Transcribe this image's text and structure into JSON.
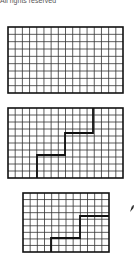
{
  "header": {
    "caption": "All rights reserved"
  },
  "figures": [
    {
      "id": "grid-plain",
      "x": 8,
      "y": 27,
      "width": 115,
      "height": 66,
      "cols": 16,
      "rows": 9,
      "path": []
    },
    {
      "id": "grid-staircase-1",
      "x": 8,
      "y": 108,
      "width": 115,
      "height": 70,
      "cols": 16,
      "rows": 10,
      "path": [
        [
          37,
          178
        ],
        [
          37,
          155
        ],
        [
          65,
          155
        ],
        [
          65,
          133
        ],
        [
          93,
          133
        ],
        [
          93,
          108
        ]
      ]
    },
    {
      "id": "grid-staircase-2",
      "x": 23,
      "y": 193,
      "width": 86,
      "height": 59,
      "cols": 12,
      "rows": 9,
      "path": [
        [
          51,
          252
        ],
        [
          51,
          238
        ],
        [
          80,
          238
        ],
        [
          80,
          216
        ],
        [
          109,
          216
        ]
      ]
    }
  ],
  "colors": {
    "line": "#333333",
    "border": "#111111",
    "path": "#111111"
  },
  "annotation": {
    "icon": "arrow-pointer"
  }
}
